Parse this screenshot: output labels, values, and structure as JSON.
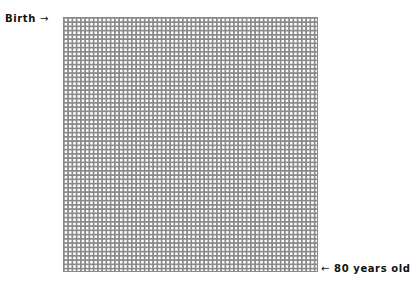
{
  "labels": {
    "start": {
      "text": "Birth",
      "arrow": "→"
    },
    "end": {
      "arrow": "←",
      "text": "80 years old"
    }
  },
  "grid": {
    "columns": 60,
    "rows": 60,
    "cell_border_color": "#8a8a8a",
    "cell_fill_color": "#ffffff",
    "filled_cells": 0
  }
}
